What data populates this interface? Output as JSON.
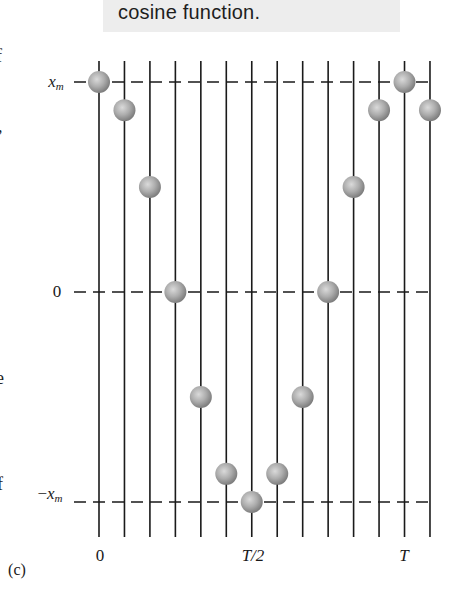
{
  "caption": {
    "text": "cosine function."
  },
  "edge_fragments": [
    {
      "text": "f",
      "x": 0,
      "y": 58
    },
    {
      "text": ",",
      "x": 0,
      "y": 128
    },
    {
      "text": "e",
      "x": 0,
      "y": 380
    },
    {
      "text": "f",
      "x": 0,
      "y": 485
    }
  ],
  "axis_labels": {
    "y_top_var": "x",
    "y_top_sub": "m",
    "y_zero": "0",
    "y_bottom_sign": "−",
    "y_bottom_var": "x",
    "y_bottom_sub": "m",
    "x_start": "0",
    "x_half": "T/2",
    "x_end": "T"
  },
  "panel_label": "(c)",
  "colors": {
    "line": "#1a1a1a",
    "caption_bg": "#ededed",
    "ball_light": "#d6d6d6",
    "ball_dark": "#808080"
  },
  "chart_data": {
    "type": "scatter",
    "title": "cosine function.",
    "xlabel": "time",
    "ylabel": "displacement x",
    "x_ticks": [
      "0",
      "T/2",
      "T"
    ],
    "y_ticks": [
      "-x_m",
      "0",
      "x_m"
    ],
    "ylim": [
      -1,
      1
    ],
    "grid": {
      "vertical_lines": 14,
      "dashed_horizontal": [
        -1,
        0,
        1
      ]
    },
    "x": [
      0,
      0.0833,
      0.1667,
      0.25,
      0.3333,
      0.4167,
      0.5,
      0.5833,
      0.6667,
      0.75,
      0.8333,
      0.9167,
      1.0,
      1.0833
    ],
    "x_units": "fraction of period T",
    "values": [
      1.0,
      0.866,
      0.5,
      0.0,
      -0.5,
      -0.866,
      -1.0,
      -0.866,
      -0.5,
      0.0,
      0.5,
      0.866,
      1.0,
      0.866
    ],
    "values_units": "fraction of x_m"
  }
}
